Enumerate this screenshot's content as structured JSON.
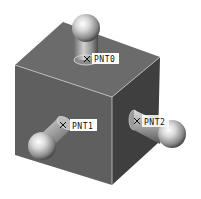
{
  "scene": {
    "background": "#ffffff",
    "cube": {
      "top_face_color": "#6b6b6b",
      "front_face_color": "#5f5f5f",
      "right_face_color": "#3f3f3f",
      "edge_highlight_color": "#c8c8c8"
    },
    "datum_points": [
      {
        "id": "pnt0",
        "label": "PNT0",
        "marker": "x-marker-icon"
      },
      {
        "id": "pnt1",
        "label": "PNT1",
        "marker": "x-marker-icon"
      },
      {
        "id": "pnt2",
        "label": "PNT2",
        "marker": "x-marker-icon"
      }
    ]
  }
}
